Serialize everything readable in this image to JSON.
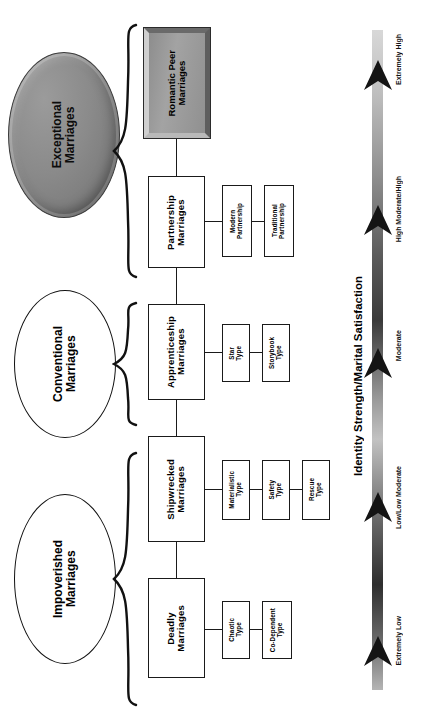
{
  "diagram": {
    "orientation": "rotated-90-ccw",
    "categories": [
      {
        "id": "exceptional",
        "label": "Exceptional\nMarriages",
        "style": "gray-3d-oval"
      },
      {
        "id": "conventional",
        "label": "Conventional\nMarriages",
        "style": "white-oval"
      },
      {
        "id": "impoverished",
        "label": "Impoverished\nMarriages",
        "style": "white-oval"
      }
    ],
    "nodes": [
      {
        "id": "romantic-peer",
        "label": "Romantic Peer\nMarriages",
        "style": "gray-3d-box",
        "subtypes": []
      },
      {
        "id": "partnership",
        "label": "Partnership\nMarriages",
        "style": "white-box",
        "subtypes": [
          {
            "id": "modern-partnership",
            "label": "Modern\nPartnership"
          },
          {
            "id": "traditional-partnership",
            "label": "Traditional\nPartnership"
          }
        ]
      },
      {
        "id": "apprenticeship",
        "label": "Apprenticeship\nMarriages",
        "style": "white-box",
        "subtypes": [
          {
            "id": "star-type",
            "label": "Star\nType"
          },
          {
            "id": "storybook-type",
            "label": "Storybook\nType"
          }
        ]
      },
      {
        "id": "shipwrecked",
        "label": "Shipwrecked\nMarriages",
        "style": "white-box",
        "subtypes": [
          {
            "id": "materialistic-type",
            "label": "Materialistic\nType"
          },
          {
            "id": "safety-type",
            "label": "Safety\nType"
          },
          {
            "id": "rescue-type",
            "label": "Rescue\nType"
          }
        ]
      },
      {
        "id": "deadly",
        "label": "Deadly\nMarriages",
        "style": "white-box",
        "subtypes": [
          {
            "id": "chaotic-type",
            "label": "Chaotic\nType"
          },
          {
            "id": "co-dependent-type",
            "label": "Co-Dependent\nType"
          }
        ]
      }
    ],
    "scale": {
      "axis_title": "Identity Strength/Marital Satisfaction",
      "levels": [
        {
          "id": "extremely-high",
          "label": "Extremely High"
        },
        {
          "id": "high-moderate-high",
          "label": "High Moderate/High"
        },
        {
          "id": "moderate",
          "label": "Moderate"
        },
        {
          "id": "low-low-moderate",
          "label": "Low/Low Moderate"
        },
        {
          "id": "extremely-low",
          "label": "Extremely Low"
        }
      ]
    },
    "colors": {
      "line": "#1a1a1a",
      "box_fill": "#ffffff",
      "accent_gray": "#8f8f8f",
      "text": "#000000"
    }
  }
}
